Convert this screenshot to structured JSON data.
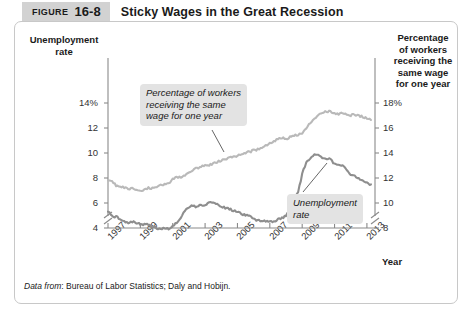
{
  "figure": {
    "label_word": "FIGURE",
    "number": "16-8",
    "title": "Sticky Wages in the Great Recession"
  },
  "source_note": {
    "prefix": "Data from",
    "text": ": Bureau of Labor Statistics; Daly and Hobijn."
  },
  "callouts": {
    "wage": "Percentage of workers\nreceiving the same\nwage for one year",
    "unemployment": "Unemployment\nrate"
  },
  "chart_data": {
    "type": "line",
    "title": "Sticky Wages in the Great Recession",
    "xlabel": "Year",
    "grid": false,
    "legend_position": "inline-annotations",
    "axis_break": true,
    "x_ticks": [
      "1997",
      "1999",
      "2001",
      "2003",
      "2005",
      "2007",
      "2009",
      "2011",
      "2013"
    ],
    "xlim": [
      1997,
      2013.5
    ],
    "left_axis": {
      "label": "Unemployment\nrate",
      "ticks": [
        "14%",
        "12",
        "10",
        "8",
        "6",
        "4"
      ],
      "tick_values": [
        14,
        12,
        10,
        8,
        6,
        4
      ],
      "ylim": [
        3.2,
        14.8
      ],
      "color": "#8c8c8c"
    },
    "right_axis": {
      "label": "Percentage\nof workers\nreceiving the\nsame wage\nfor one year",
      "ticks": [
        "18%",
        "16",
        "14",
        "12",
        "10",
        "8"
      ],
      "tick_values": [
        18,
        16,
        14,
        12,
        10,
        8
      ],
      "ylim": [
        7.2,
        18.8
      ],
      "color": "#b8b8b8"
    },
    "series": [
      {
        "name": "Percentage of workers receiving the same wage for one year",
        "axis": "right",
        "color": "#b9b9b9",
        "x": [
          1997.0,
          1997.25,
          1997.5,
          1997.75,
          1998.0,
          1998.25,
          1998.5,
          1998.75,
          1999.0,
          1999.25,
          1999.5,
          1999.75,
          2000.0,
          2000.25,
          2000.5,
          2000.75,
          2001.0,
          2001.25,
          2001.5,
          2001.75,
          2002.0,
          2002.25,
          2002.5,
          2002.75,
          2003.0,
          2003.25,
          2003.5,
          2003.75,
          2004.0,
          2004.25,
          2004.5,
          2004.75,
          2005.0,
          2005.25,
          2005.5,
          2005.75,
          2006.0,
          2006.25,
          2006.5,
          2006.75,
          2007.0,
          2007.25,
          2007.5,
          2007.75,
          2008.0,
          2008.25,
          2008.5,
          2008.75,
          2009.0,
          2009.25,
          2009.5,
          2009.75,
          2010.0,
          2010.25,
          2010.5,
          2010.75,
          2011.0,
          2011.25,
          2011.5,
          2011.75,
          2012.0,
          2012.25,
          2012.5,
          2012.75,
          2013.0,
          2013.25
        ],
        "values": [
          11.9,
          11.7,
          11.4,
          11.3,
          11.2,
          11.1,
          11.2,
          11.1,
          11.0,
          11.1,
          11.2,
          11.2,
          11.3,
          11.4,
          11.5,
          11.6,
          11.9,
          12.1,
          12.0,
          12.2,
          12.4,
          12.6,
          12.8,
          12.9,
          13.1,
          13.0,
          13.2,
          13.3,
          13.4,
          13.5,
          13.6,
          13.7,
          13.8,
          13.9,
          14.0,
          14.1,
          14.2,
          14.3,
          14.4,
          14.6,
          14.8,
          14.9,
          15.1,
          15.2,
          15.1,
          15.3,
          15.4,
          15.4,
          15.6,
          16.0,
          16.4,
          16.8,
          17.0,
          17.2,
          17.3,
          17.3,
          17.2,
          17.1,
          17.2,
          17.1,
          17.0,
          17.1,
          17.0,
          16.9,
          16.8,
          16.7
        ]
      },
      {
        "name": "Unemployment rate",
        "axis": "left",
        "color": "#8e8e8e",
        "x": [
          1997.0,
          1997.25,
          1997.5,
          1997.75,
          1998.0,
          1998.25,
          1998.5,
          1998.75,
          1999.0,
          1999.25,
          1999.5,
          1999.75,
          2000.0,
          2000.25,
          2000.5,
          2000.75,
          2001.0,
          2001.25,
          2001.5,
          2001.75,
          2002.0,
          2002.25,
          2002.5,
          2002.75,
          2003.0,
          2003.25,
          2003.5,
          2003.75,
          2004.0,
          2004.25,
          2004.5,
          2004.75,
          2005.0,
          2005.25,
          2005.5,
          2005.75,
          2006.0,
          2006.25,
          2006.5,
          2006.75,
          2007.0,
          2007.25,
          2007.5,
          2007.75,
          2008.0,
          2008.25,
          2008.5,
          2008.75,
          2009.0,
          2009.25,
          2009.5,
          2009.75,
          2010.0,
          2010.25,
          2010.5,
          2010.75,
          2011.0,
          2011.25,
          2011.5,
          2011.75,
          2012.0,
          2012.25,
          2012.5,
          2012.75,
          2013.0,
          2013.25
        ],
        "values": [
          5.3,
          5.0,
          4.9,
          4.7,
          4.6,
          4.4,
          4.5,
          4.4,
          4.3,
          4.3,
          4.3,
          4.1,
          4.0,
          3.9,
          4.0,
          3.9,
          4.2,
          4.4,
          4.8,
          5.4,
          5.7,
          5.8,
          5.7,
          5.9,
          5.8,
          6.1,
          6.1,
          5.9,
          5.7,
          5.6,
          5.5,
          5.4,
          5.3,
          5.1,
          5.0,
          5.0,
          4.7,
          4.6,
          4.6,
          4.5,
          4.5,
          4.5,
          4.7,
          4.8,
          5.0,
          5.4,
          6.1,
          6.9,
          8.3,
          9.3,
          9.6,
          9.9,
          9.8,
          9.6,
          9.5,
          9.5,
          9.1,
          9.1,
          9.0,
          8.7,
          8.3,
          8.2,
          8.0,
          7.8,
          7.6,
          7.5
        ]
      }
    ],
    "annotations": [
      {
        "text": "Percentage of workers receiving the same wage for one year",
        "points_to_series": "Percentage of workers receiving the same wage for one year"
      },
      {
        "text": "Unemployment rate",
        "points_to_series": "Unemployment rate"
      }
    ]
  }
}
